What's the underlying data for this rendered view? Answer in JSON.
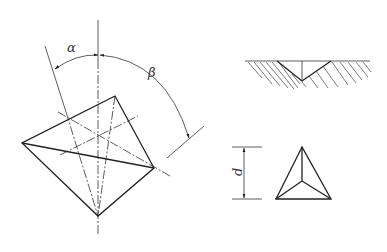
{
  "labels": {
    "alpha": "α",
    "beta": "β",
    "d": "d"
  },
  "figures": {
    "pyramid_view": "indenter-geometry",
    "cross_section": "indentation-section",
    "top_view": "triangular-indent"
  }
}
